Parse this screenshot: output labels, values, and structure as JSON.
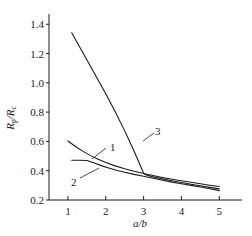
{
  "chart_data": {
    "type": "line",
    "title": "",
    "subtitle": "",
    "xlabel": "a/b",
    "ylabel": "Rp/Rc",
    "ylabel_parts": {
      "num_base": "R",
      "num_sub": "p",
      "slash": "/",
      "den_base": "R",
      "den_sub": "c"
    },
    "xlim": [
      0.5,
      5.6
    ],
    "ylim": [
      0.2,
      1.47
    ],
    "xticks": [
      1,
      2,
      3,
      4,
      5
    ],
    "xtick_labels": [
      "1",
      "2",
      "3",
      "4",
      "5"
    ],
    "yticks": [
      0.2,
      0.4,
      0.6,
      0.8,
      1.0,
      1.2,
      1.4
    ],
    "ytick_labels": [
      "0.2",
      "0.4",
      "0.6",
      "0.8",
      "1.0",
      "1.2",
      "1.4"
    ],
    "grid": false,
    "legend": "inline-curve-labels",
    "line_color": "#1a1a1a",
    "series": [
      {
        "name": "1",
        "label": "1",
        "x": [
          1.0,
          1.2,
          1.4,
          1.6,
          1.8,
          2.0,
          2.25,
          2.5,
          2.75,
          3.0,
          3.25,
          3.5,
          3.75,
          4.0,
          4.25,
          4.5,
          4.75,
          5.0
        ],
        "values": [
          0.603,
          0.565,
          0.532,
          0.503,
          0.478,
          0.456,
          0.433,
          0.413,
          0.396,
          0.381,
          0.367,
          0.354,
          0.342,
          0.331,
          0.321,
          0.311,
          0.301,
          0.292
        ]
      },
      {
        "name": "2",
        "label": "2",
        "x": [
          1.1,
          1.3,
          1.5,
          1.7,
          1.9,
          2.1,
          2.3,
          2.5,
          2.75,
          3.0,
          3.25,
          3.5,
          3.75,
          4.0,
          4.25,
          4.5,
          4.75,
          5.0
        ],
        "values": [
          0.471,
          0.471,
          0.47,
          0.452,
          0.433,
          0.417,
          0.402,
          0.389,
          0.375,
          0.362,
          0.348,
          0.335,
          0.322,
          0.311,
          0.3,
          0.289,
          0.277,
          0.264
        ]
      },
      {
        "name": "3",
        "label": "3",
        "x": [
          1.1,
          1.3,
          1.5,
          1.75,
          2.0,
          2.25,
          2.5,
          2.75,
          3.0,
          3.05,
          3.25,
          3.5,
          3.75,
          4.0,
          4.25,
          4.5,
          4.75,
          5.0
        ],
        "values": [
          1.342,
          1.25,
          1.158,
          1.042,
          0.925,
          0.802,
          0.672,
          0.533,
          0.383,
          0.372,
          0.358,
          0.344,
          0.331,
          0.319,
          0.308,
          0.297,
          0.286,
          0.276
        ]
      }
    ],
    "curve_label_annotations": [
      {
        "text": "1",
        "label_x": 110,
        "label_y": 142,
        "leader_from_x": 106,
        "leader_from_y": 148,
        "leader_to_x": 92,
        "leader_to_y": 159
      },
      {
        "text": "2",
        "label_x": 71,
        "label_y": 177,
        "leader_from_x": 80,
        "leader_from_y": 178,
        "leader_to_x": 99,
        "leader_to_y": 168
      },
      {
        "text": "3",
        "label_x": 155,
        "label_y": 126,
        "leader_from_x": 154,
        "leader_from_y": 133,
        "leader_to_x": 143,
        "leader_to_y": 141
      }
    ]
  },
  "axes": {
    "x_axis_name": "x-axis",
    "y_axis_name": "y-axis"
  }
}
